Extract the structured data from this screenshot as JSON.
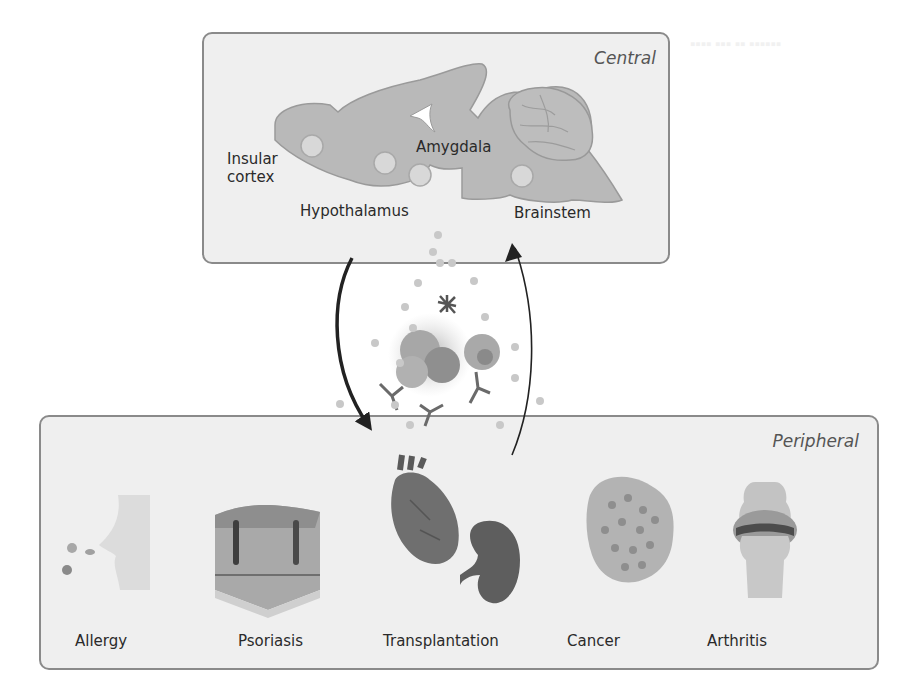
{
  "central": {
    "title": "Central",
    "regions": [
      {
        "label_line1": "Insular",
        "label_line2": "cortex"
      },
      {
        "label": "Hypothalamus"
      },
      {
        "label": "Amygdala"
      },
      {
        "label": "Brainstem"
      }
    ]
  },
  "peripheral": {
    "title": "Peripheral",
    "conditions": [
      {
        "label": "Allergy"
      },
      {
        "label": "Psoriasis"
      },
      {
        "label": "Transplantation"
      },
      {
        "label": "Cancer"
      },
      {
        "label": "Arthritis"
      }
    ]
  },
  "colors": {
    "panel_border": "#8a8a8a",
    "panel_fill": "#efefef",
    "brain_fill": "#b9b9b9",
    "arrow": "#222222"
  }
}
